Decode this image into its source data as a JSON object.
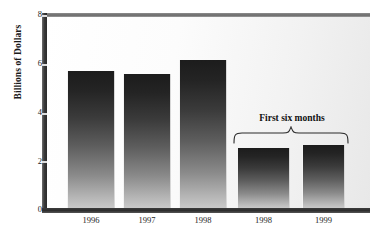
{
  "chart_data": {
    "type": "bar",
    "title": "",
    "subtitle": "",
    "xlabel": "",
    "ylabel": "Billions of Dollars",
    "categories": [
      "1996",
      "1997",
      "1998",
      "1998",
      "1999"
    ],
    "values": [
      5.75,
      5.6,
      6.2,
      2.5,
      2.65
    ],
    "ylim": [
      0,
      8
    ],
    "yticks": [
      "0",
      "2",
      "4",
      "6",
      "8"
    ],
    "ytick_values": [
      0,
      2,
      4,
      6,
      8
    ],
    "grid": false,
    "legend": null,
    "annotations": [
      {
        "text": "First six months",
        "covers_categories": [
          "1998",
          "1999"
        ],
        "covers_bar_indices": [
          3,
          4
        ],
        "style": "curly-brace-above"
      }
    ],
    "series": [
      {
        "name": "Amount",
        "values": [
          5.75,
          5.6,
          6.2,
          2.5,
          2.65
        ]
      }
    ]
  },
  "axis": {
    "y_title": "Billions of Dollars",
    "y_ticks": [
      {
        "label": "8",
        "value": 8
      },
      {
        "label": "6",
        "value": 6
      },
      {
        "label": "4",
        "value": 4
      },
      {
        "label": "2",
        "value": 2
      },
      {
        "label": "0",
        "value": 0
      }
    ],
    "x_ticks": [
      {
        "label": "1996"
      },
      {
        "label": "1997"
      },
      {
        "label": "1998"
      },
      {
        "label": "1998"
      },
      {
        "label": "1999"
      }
    ]
  },
  "annotation": {
    "label": "First six months"
  },
  "colors": {
    "bar_top": "#1c1c1c",
    "bar_bottom": "#c9c9c9",
    "axis": "#2d2d2d",
    "plot_background": "#fbfbfb",
    "text": "#1a1a1a"
  }
}
